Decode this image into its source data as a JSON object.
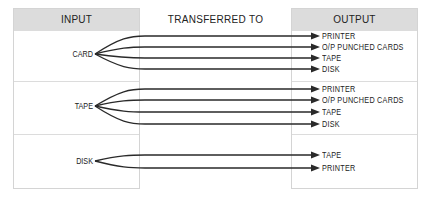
{
  "headers": {
    "input": "INPUT",
    "transfer": "TRANSFERRED TO",
    "output": "OUTPUT"
  },
  "groups": [
    {
      "input": "CARD",
      "outputs": [
        "PRINTER",
        "O/P PUNCHED CARDS",
        "TAPE",
        "DISK"
      ]
    },
    {
      "input": "TAPE",
      "outputs": [
        "PRINTER",
        "O/P PUNCHED CARDS",
        "TAPE",
        "DISK"
      ]
    },
    {
      "input": "DISK",
      "outputs": [
        "TAPE",
        "PRINTER"
      ]
    }
  ],
  "colors": {
    "header_bg": "#dcdcdc",
    "line": "#2a2a2a",
    "border": "#d4d4d4"
  }
}
